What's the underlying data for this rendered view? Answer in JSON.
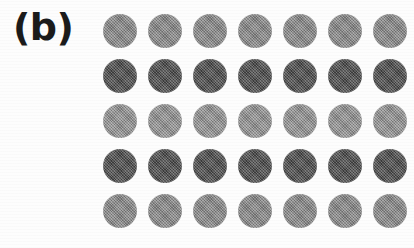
{
  "figure": {
    "panel_label": "(b)",
    "background_color": "#fdfdfd",
    "label_color": "#1b1b1b",
    "width": 414,
    "height": 248
  },
  "chart_data": {
    "type": "heatmap",
    "title": "(b)",
    "subtitle": "",
    "xlabel": "",
    "ylabel": "",
    "rows": 5,
    "columns": 7,
    "grid": {
      "origin_x": 103,
      "origin_y": 14,
      "column_pitch": 45,
      "row_pitch": 45,
      "dot_diameter": 34
    },
    "row_labels": [
      "row-1",
      "row-2",
      "row-3",
      "row-4",
      "row-5"
    ],
    "column_labels": [
      "col-1",
      "col-2",
      "col-3",
      "col-4",
      "col-5",
      "col-6",
      "col-7"
    ],
    "legend": [],
    "grid_on": false,
    "row_colors": [
      "#8a8a8a",
      "#4a4a4a",
      "#949494",
      "#4a4a4a",
      "#8a8a8a"
    ],
    "row_intensity": [
      0.54,
      0.29,
      0.58,
      0.29,
      0.54
    ],
    "values": [
      [
        138,
        138,
        138,
        138,
        138,
        138,
        138
      ],
      [
        74,
        74,
        74,
        74,
        74,
        74,
        74
      ],
      [
        148,
        148,
        148,
        148,
        148,
        148,
        148
      ],
      [
        74,
        74,
        74,
        74,
        74,
        74,
        74
      ],
      [
        138,
        138,
        138,
        138,
        138,
        138,
        138
      ]
    ],
    "colors": [
      [
        "#8a8a8a",
        "#8a8a8a",
        "#8a8a8a",
        "#8a8a8a",
        "#8a8a8a",
        "#8a8a8a",
        "#8a8a8a"
      ],
      [
        "#4a4a4a",
        "#4a4a4a",
        "#4a4a4a",
        "#4a4a4a",
        "#4a4a4a",
        "#4a4a4a",
        "#4a4a4a"
      ],
      [
        "#949494",
        "#949494",
        "#949494",
        "#949494",
        "#949494",
        "#949494",
        "#949494"
      ],
      [
        "#4a4a4a",
        "#4a4a4a",
        "#4a4a4a",
        "#4a4a4a",
        "#4a4a4a",
        "#4a4a4a",
        "#4a4a4a"
      ],
      [
        "#8a8a8a",
        "#8a8a8a",
        "#8a8a8a",
        "#8a8a8a",
        "#8a8a8a",
        "#8a8a8a",
        "#8a8a8a"
      ]
    ]
  }
}
